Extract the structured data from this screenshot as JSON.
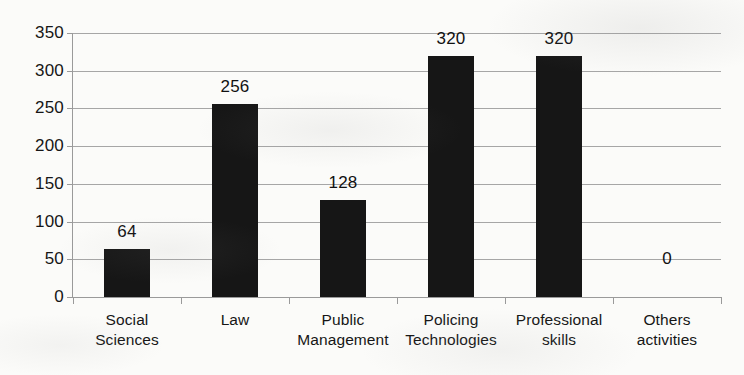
{
  "chart_data": {
    "type": "bar",
    "title": "",
    "subtitle": "",
    "xlabel": "",
    "ylabel": "",
    "categories": [
      "Social Sciences",
      "Law",
      "Public Management",
      "Policing Technologies",
      "Professional skills",
      "Others activities"
    ],
    "category_lines": [
      [
        "Social",
        "Sciences"
      ],
      [
        "Law",
        ""
      ],
      [
        "Public",
        "Management"
      ],
      [
        "Policing",
        "Technologies"
      ],
      [
        "Professional",
        "skills"
      ],
      [
        "Others",
        "activities"
      ]
    ],
    "values": [
      64,
      256,
      128,
      320,
      320,
      0
    ],
    "data_labels": [
      "64",
      "256",
      "128",
      "320",
      "320",
      "0"
    ],
    "ylim": [
      0,
      350
    ],
    "ytick_values": [
      0,
      50,
      100,
      150,
      200,
      250,
      300,
      350
    ],
    "ytick_labels": [
      "0",
      "50",
      "100",
      "150",
      "200",
      "250",
      "300",
      "350"
    ],
    "grid": true,
    "grid_axis": "y",
    "legend": false,
    "legend_position": "none",
    "bar_color": "#161616",
    "gridline_color": "#a6a6a6",
    "axis_color": "#9a9a9a",
    "background_color": "#fbfbf9",
    "text_color": "#161616"
  }
}
